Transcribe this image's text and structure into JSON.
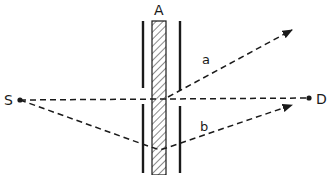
{
  "diagram": {
    "type": "interference-path-diagram",
    "labels": {
      "slab": "A",
      "source": "S",
      "detector": "D",
      "path_a": "a",
      "path_b": "b"
    },
    "colors": {
      "ink": "#1a1a1a",
      "background": "#ffffff"
    },
    "elements": {
      "source_point": {
        "x": 20,
        "y": 100
      },
      "detector_point": {
        "x": 311,
        "y": 98
      },
      "slab": {
        "x": 152,
        "y": 21,
        "width": 14,
        "height": 154,
        "fill": "hatched"
      },
      "left_barrier": {
        "x": 143,
        "segments": [
          [
            21,
            88
          ],
          [
            104,
            173
          ]
        ]
      },
      "right_barrier": {
        "x": 180,
        "segments": [
          [
            21,
            91
          ],
          [
            106,
            173
          ]
        ]
      }
    },
    "paths": [
      {
        "name": "direct",
        "style": "dashed",
        "from": "S",
        "to": "D"
      },
      {
        "name": "a",
        "style": "dashed-arrow",
        "from": "slab",
        "to": "upper-right"
      },
      {
        "name": "b",
        "style": "dashed-arrow",
        "from": "S",
        "via": "slab-bottom",
        "to": "right"
      }
    ]
  }
}
